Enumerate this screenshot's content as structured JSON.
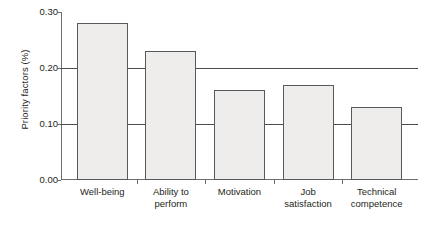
{
  "chart_data": {
    "type": "bar",
    "title": "",
    "subtitle": "",
    "xlabel": "",
    "ylabel": "Priority factors (%)",
    "categories": [
      "Well-being",
      "Ability to perform",
      "Motivation",
      "Job satisfaction",
      "Technical competence"
    ],
    "category_lines": [
      [
        "Well-being",
        ""
      ],
      [
        "Ability to",
        "perform"
      ],
      [
        "Motivation",
        ""
      ],
      [
        "Job",
        "satisfaction"
      ],
      [
        "Technical",
        "competence"
      ]
    ],
    "values": [
      0.28,
      0.23,
      0.16,
      0.17,
      0.13
    ],
    "ylim": [
      0.0,
      0.3
    ],
    "yticks": [
      0.0,
      0.1,
      0.2,
      0.3
    ],
    "ytick_labels": [
      "0.00",
      "0.10",
      "0.20",
      "0.30"
    ],
    "gridlines_at": [
      0.1,
      0.2
    ],
    "grid": true,
    "legend": false,
    "legend_position": "none",
    "bar_fill": "#eeedeb",
    "bar_border": "#58595b",
    "axis_color": "#6d6e71",
    "grid_color": "#4d4d4f",
    "text_color": "#231f20"
  }
}
